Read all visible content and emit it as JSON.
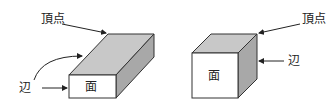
{
  "diagram": {
    "cuboid": {
      "vertex_label": "頂点",
      "edge_label": "辺",
      "face_label": "面"
    },
    "cube": {
      "vertex_label": "頂点",
      "edge_label": "辺",
      "face_label": "面"
    },
    "colors": {
      "top_face": "#c8c8c8",
      "side_face": "#a8a8a8",
      "front_face": "#ffffff",
      "stroke": "#333333"
    }
  }
}
